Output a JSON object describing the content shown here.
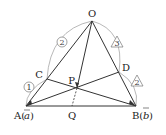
{
  "diagram": {
    "type": "geometry-vector-triangle",
    "points": {
      "O": {
        "label": "O",
        "x": 92,
        "y": 21
      },
      "A": {
        "label": "A(a)",
        "x": 26,
        "y": 106
      },
      "B": {
        "label": "B(b)",
        "x": 136,
        "y": 106
      },
      "C": {
        "label": "C",
        "x": 47,
        "y": 79
      },
      "D": {
        "label": "D",
        "x": 119,
        "y": 72
      },
      "P": {
        "label": "P",
        "x": 77,
        "y": 88
      },
      "Q": {
        "label": "Q",
        "x": 72,
        "y": 106
      }
    },
    "labels": {
      "O": "O",
      "A_prefix": "A(",
      "A_vec": "a",
      "A_suffix": ")",
      "B_prefix": "B(",
      "B_vec": "b",
      "B_suffix": ")",
      "C": "C",
      "D": "D",
      "P": "P",
      "Q": "Q"
    },
    "ratios": {
      "OC": "2",
      "CA": "1",
      "OD": "3",
      "DB": "2"
    },
    "ratio_shapes": {
      "OC": "circle",
      "CA": "circle",
      "OD": "triangle",
      "DB": "triangle"
    }
  }
}
